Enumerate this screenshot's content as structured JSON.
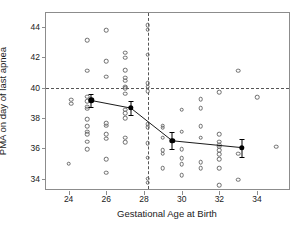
{
  "chart_data": {
    "type": "scatter",
    "title": "",
    "xlabel": "Gestational Age at Birth",
    "ylabel": "PMA on day of last apnea",
    "xlim": [
      22.8,
      35.8
    ],
    "ylim": [
      33.2,
      44.9
    ],
    "xticks": [
      24,
      26,
      28,
      30,
      32,
      34
    ],
    "yticks": [
      34,
      36,
      38,
      40,
      42,
      44
    ],
    "grid": false,
    "legend": null,
    "reference_lines": [
      {
        "name": "pma-40-threshold",
        "orientation": "horizontal",
        "value": 40,
        "style": "dashed"
      },
      {
        "name": "ga-28-threshold",
        "orientation": "vertical",
        "value": 28.2,
        "style": "dashed"
      }
    ],
    "series": [
      {
        "name": "individual-infants",
        "marker": "open-circle",
        "points": [
          [
            24.0,
            35.0
          ],
          [
            24.15,
            39.2
          ],
          [
            24.15,
            38.95
          ],
          [
            25.0,
            43.1
          ],
          [
            25.0,
            41.1
          ],
          [
            25.0,
            39.4
          ],
          [
            25.0,
            39.1
          ],
          [
            25.0,
            38.75
          ],
          [
            25.0,
            38.6
          ],
          [
            25.0,
            37.9
          ],
          [
            25.0,
            37.45
          ],
          [
            25.0,
            37.1
          ],
          [
            25.0,
            36.95
          ],
          [
            25.0,
            36.45
          ],
          [
            25.0,
            35.95
          ],
          [
            26.0,
            43.75
          ],
          [
            26.0,
            41.75
          ],
          [
            26.0,
            40.7
          ],
          [
            26.0,
            37.65
          ],
          [
            26.0,
            37.5
          ],
          [
            26.0,
            36.95
          ],
          [
            26.0,
            36.65
          ],
          [
            26.0,
            35.3
          ],
          [
            26.0,
            34.4
          ],
          [
            27.0,
            42.3
          ],
          [
            27.0,
            41.95
          ],
          [
            27.0,
            41.15
          ],
          [
            27.0,
            40.65
          ],
          [
            27.0,
            40.45
          ],
          [
            27.0,
            40.05
          ],
          [
            27.0,
            39.95
          ],
          [
            27.0,
            39.6
          ],
          [
            27.0,
            38.55
          ],
          [
            27.0,
            38.3
          ],
          [
            27.0,
            38.0
          ],
          [
            27.0,
            36.7
          ],
          [
            27.0,
            36.4
          ],
          [
            28.2,
            44.1
          ],
          [
            28.2,
            43.8
          ],
          [
            28.2,
            42.15
          ],
          [
            28.2,
            40.3
          ],
          [
            28.2,
            40.05
          ],
          [
            28.2,
            39.75
          ],
          [
            28.2,
            37.6
          ],
          [
            28.2,
            37.4
          ],
          [
            28.2,
            36.35
          ],
          [
            28.2,
            35.4
          ],
          [
            28.2,
            34.0
          ],
          [
            28.2,
            33.75
          ],
          [
            29.0,
            37.5
          ],
          [
            29.0,
            37.35
          ],
          [
            29.0,
            36.7
          ],
          [
            29.0,
            35.9
          ],
          [
            29.0,
            35.65
          ],
          [
            29.0,
            34.7
          ],
          [
            30.0,
            38.55
          ],
          [
            30.0,
            37.1
          ],
          [
            30.0,
            35.95
          ],
          [
            30.0,
            35.35
          ],
          [
            30.0,
            34.95
          ],
          [
            30.0,
            34.25
          ],
          [
            31.0,
            39.25
          ],
          [
            31.0,
            38.65
          ],
          [
            31.0,
            37.45
          ],
          [
            31.0,
            36.7
          ],
          [
            31.0,
            35.1
          ],
          [
            31.0,
            34.7
          ],
          [
            32.0,
            39.7
          ],
          [
            32.0,
            36.95
          ],
          [
            32.0,
            36.45
          ],
          [
            32.0,
            36.25
          ],
          [
            32.0,
            36.1
          ],
          [
            32.0,
            35.9
          ],
          [
            32.0,
            35.6
          ],
          [
            32.0,
            35.3
          ],
          [
            32.0,
            34.7
          ],
          [
            32.0,
            33.6
          ],
          [
            33.0,
            41.1
          ],
          [
            33.0,
            35.65
          ],
          [
            33.0,
            33.95
          ],
          [
            34.0,
            39.35
          ],
          [
            35.0,
            36.1
          ]
        ]
      },
      {
        "name": "group-mean",
        "marker": "filled-circle",
        "line": true,
        "points": [
          {
            "x": 25.2,
            "y": 39.15,
            "err": 0.45
          },
          {
            "x": 27.3,
            "y": 38.65,
            "err": 0.45
          },
          {
            "x": 29.5,
            "y": 36.5,
            "err": 0.55
          },
          {
            "x": 33.2,
            "y": 36.05,
            "err": 0.6
          }
        ]
      }
    ]
  }
}
